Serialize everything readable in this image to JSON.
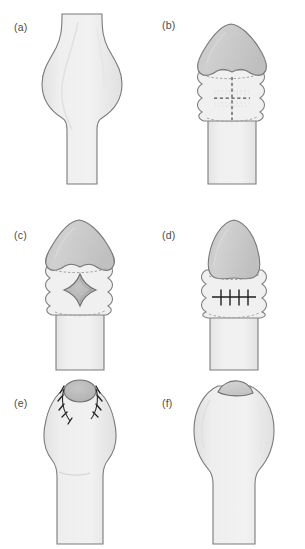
{
  "figure": {
    "domain": "Diagram",
    "kind": "surgical-technique-illustration",
    "caption_labels": [
      "(a)",
      "(b)",
      "(c)",
      "(d)",
      "(e)",
      "(f)"
    ],
    "background_color": "#ffffff",
    "panel_count": 6
  },
  "palette": {
    "page_background": "#ffffff",
    "shaft_fill": "#ededed",
    "shaft_fill_light": "#f3f3f3",
    "glans_fill": "#c9c9c9",
    "glans_fill_dark": "#bdbdbd",
    "graft_fill": "#b4b4b4",
    "outline": "#6e6e6e",
    "outline_soft": "#9a9a9a",
    "dashed_line": "#555555",
    "suture_ink": "#1d1d1d",
    "label_text": "#4a4a4a"
  },
  "panels": [
    {
      "id": "panel-a",
      "label": "(a)",
      "name": "panel-a-preoperative-bulge",
      "description": "Preoperative appearance: shaft with a smooth fusiform bulge"
    },
    {
      "id": "panel-b",
      "label": "(b)",
      "name": "panel-b-incision-marking",
      "description": "Glans retracted with corrugated foreskin collar; dashed cruciate incision marking on the shaft skin"
    },
    {
      "id": "panel-c",
      "label": "(c)",
      "name": "panel-c-rhomboid-excision",
      "description": "Rhomboid (diamond) shaped excision defect created in the shaft skin"
    },
    {
      "id": "panel-d",
      "label": "(d)",
      "name": "panel-d-transverse-closure",
      "description": "Transverse closure of the defect with four interrupted sutures"
    },
    {
      "id": "panel-e",
      "label": "(e)",
      "name": "panel-e-grafted-tip-sutured",
      "description": "Grafted disc at the tip secured with interrupted circumferential sutures"
    },
    {
      "id": "panel-f",
      "label": "(f)",
      "name": "panel-f-healed-result",
      "description": "Healed postoperative result with smooth contour and small tip cap"
    }
  ],
  "marks": {
    "panel_b": {
      "vertical_dashed_marking": "vertical dashed incision line",
      "horizontal_dashed_marking": "horizontal dashed incision line",
      "foreskin_fold_count": 4
    },
    "panel_c": {
      "defect_shape": "rhomboid",
      "defect_orientation": "vertical long axis"
    },
    "panel_d": {
      "suture_count": 4,
      "closure_orientation": "transverse"
    },
    "panel_e": {
      "suture_count": 9,
      "graft_shape": "circular"
    }
  }
}
